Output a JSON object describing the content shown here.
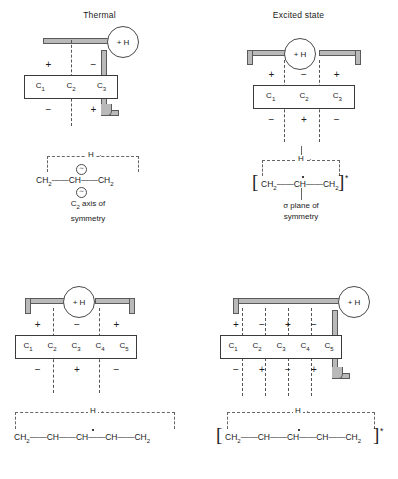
{
  "figure": {
    "panels": [
      {
        "id": "thermal-triene-3c",
        "title": "Thermal",
        "mo": {
          "carbon_labels": [
            "C",
            "C",
            "C"
          ],
          "carbon_subscripts": [
            "1",
            "2",
            "3"
          ],
          "signs_top": [
            "+",
            "−"
          ],
          "signs_bottom": [
            "−",
            "+"
          ],
          "nodal_count": 1,
          "h_label": "+ H",
          "bond_style": "suprafacial-antarafacial"
        },
        "structure": {
          "h_atom": "H",
          "formula_parts": [
            "CH",
            "2",
            "=",
            "CH",
            "=",
            "CH",
            "2"
          ],
          "formula_text": "CH2=CH=CH2",
          "bracketed": false,
          "excited_marker": "",
          "symmetry_label_line1": "C2 axis of",
          "symmetry_label_line2": "symmetry",
          "symmetry_element": "C₂ axis",
          "axis_marker_glyph": "∼"
        }
      },
      {
        "id": "excited-triene-3c",
        "title": "Excited state",
        "mo": {
          "carbon_labels": [
            "C",
            "C",
            "C"
          ],
          "carbon_subscripts": [
            "1",
            "2",
            "3"
          ],
          "signs_top": [
            "+",
            "−",
            "+"
          ],
          "signs_bottom": [
            "−",
            "+",
            "−"
          ],
          "nodal_count": 2,
          "h_label": "+ H",
          "bond_style": "suprafacial-suprafacial"
        },
        "structure": {
          "h_atom": "H",
          "formula_text": "CH2=CH=CH2",
          "bracketed": true,
          "excited_marker": "*",
          "symmetry_label_line1": "σ plane of",
          "symmetry_label_line2": "symmetry",
          "symmetry_element": "σ plane"
        }
      },
      {
        "id": "thermal-pentadienyl-5c",
        "title": "",
        "mo": {
          "carbon_labels": [
            "C",
            "C",
            "C",
            "C",
            "C"
          ],
          "carbon_subscripts": [
            "1",
            "2",
            "3",
            "4",
            "5"
          ],
          "signs_top": [
            "+",
            "−",
            "+"
          ],
          "signs_bottom": [
            "−",
            "+",
            "−"
          ],
          "nodal_count": 2,
          "h_label": "+ H",
          "bond_style": "suprafacial-suprafacial"
        },
        "structure": {
          "h_atom": "H",
          "formula_text": "CH2=CH=CH=CH=CH2",
          "bracketed": false,
          "excited_marker": "",
          "symmetry_label_line1": "",
          "symmetry_label_line2": ""
        }
      },
      {
        "id": "excited-pentadienyl-5c",
        "title": "",
        "mo": {
          "carbon_labels": [
            "C",
            "C",
            "C",
            "C",
            "C"
          ],
          "carbon_subscripts": [
            "1",
            "2",
            "3",
            "4",
            "5"
          ],
          "signs_top": [
            "+",
            "−",
            "+",
            "−"
          ],
          "signs_bottom": [
            "−",
            "+",
            "−",
            "+"
          ],
          "nodal_count": 4,
          "h_label": "+ H",
          "bond_style": "suprafacial-antarafacial"
        },
        "structure": {
          "h_atom": "H",
          "formula_text": "CH2=CH=CH=CH=CH2",
          "bracketed": true,
          "excited_marker": "*",
          "symmetry_label_line1": "",
          "symmetry_label_line2": ""
        }
      }
    ],
    "colors": {
      "band_fill": "#b9b9b9",
      "band_stroke": "#5a5a5a",
      "box_stroke": "#3a3a3a",
      "dashed_stroke": "#666666",
      "text": "#1b1b1b",
      "background": "#ffffff"
    }
  }
}
